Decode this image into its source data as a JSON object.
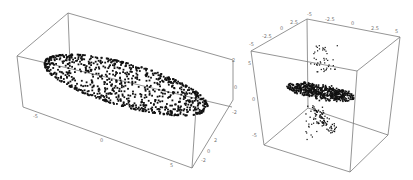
{
  "chart_data": [
    {
      "type": "scatter",
      "subtype": "3d-scatter",
      "title": "",
      "description": "Ellipsoidal shell point cloud in a 3D bounding box",
      "axes": {
        "x": {
          "ticks": [
            "-5",
            "0",
            "5"
          ],
          "range": [
            -7,
            7
          ]
        },
        "y": {
          "ticks": [
            "-2",
            "0",
            "2"
          ],
          "range": [
            -3,
            3
          ]
        },
        "z": {
          "ticks": [
            "-2",
            "0",
            "2"
          ],
          "range": [
            -3,
            3
          ]
        }
      },
      "points_approx": 900,
      "grid": false,
      "box": true,
      "color": "#111111"
    },
    {
      "type": "scatter",
      "subtype": "3d-scatter",
      "title": "",
      "description": "Flattened disk-shaped point cluster with sparse vertical jets above and below, in a cubic bounding box",
      "axes": {
        "x": {
          "ticks": [
            "-5",
            "-2.5",
            "0",
            "2.5",
            "5"
          ],
          "range": [
            -5,
            5
          ]
        },
        "y": {
          "ticks": [
            "-5",
            "-2.5",
            "0",
            "2.5"
          ],
          "range": [
            -5,
            5
          ]
        },
        "z": {
          "ticks": [
            "5",
            "0",
            "-5"
          ],
          "range": [
            -8,
            8
          ]
        }
      },
      "points_approx": 700,
      "grid": false,
      "box": true,
      "color": "#111111"
    }
  ],
  "left_plot": {
    "ticks_x": [
      {
        "label": "-5",
        "x": 33,
        "y": 118
      },
      {
        "label": "0",
        "x": 100,
        "y": 142
      },
      {
        "label": "5",
        "x": 170,
        "y": 167
      }
    ],
    "ticks_right": [
      {
        "label": "2",
        "x": 232,
        "y": 62
      },
      {
        "label": "0",
        "x": 234,
        "y": 89
      },
      {
        "label": "-2",
        "x": 232,
        "y": 114
      },
      {
        "label": "2",
        "x": 214,
        "y": 142
      },
      {
        "label": "0",
        "x": 207,
        "y": 153
      },
      {
        "label": "-2",
        "x": 201,
        "y": 162
      }
    ]
  },
  "right_plot": {
    "ticks_top_left": [
      {
        "label": "-5",
        "x": 249,
        "y": 46
      },
      {
        "label": "-2.5",
        "x": 262,
        "y": 38
      },
      {
        "label": "0",
        "x": 280,
        "y": 30
      },
      {
        "label": "2.5",
        "x": 290,
        "y": 24
      },
      {
        "label": "-5",
        "x": 307,
        "y": 16
      }
    ],
    "ticks_top_back": [
      {
        "label": "-2.5",
        "x": 325,
        "y": 21
      },
      {
        "label": "0",
        "x": 351,
        "y": 25
      },
      {
        "label": "2.5",
        "x": 371,
        "y": 30
      },
      {
        "label": "5",
        "x": 395,
        "y": 33
      }
    ],
    "ticks_left": [
      {
        "label": "5",
        "x": 248,
        "y": 65
      },
      {
        "label": "0",
        "x": 252,
        "y": 101
      },
      {
        "label": "-5",
        "x": 252,
        "y": 137
      }
    ]
  }
}
